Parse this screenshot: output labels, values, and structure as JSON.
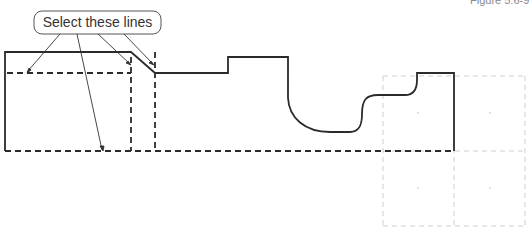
{
  "figure": {
    "label": "Figure 5.6-9",
    "callout": "Select these lines"
  },
  "colors": {
    "profile": "#2b2b2b",
    "dashed_geometry": "#2b2b2b",
    "grid": "#cfcfcf",
    "leader": "#333333"
  }
}
